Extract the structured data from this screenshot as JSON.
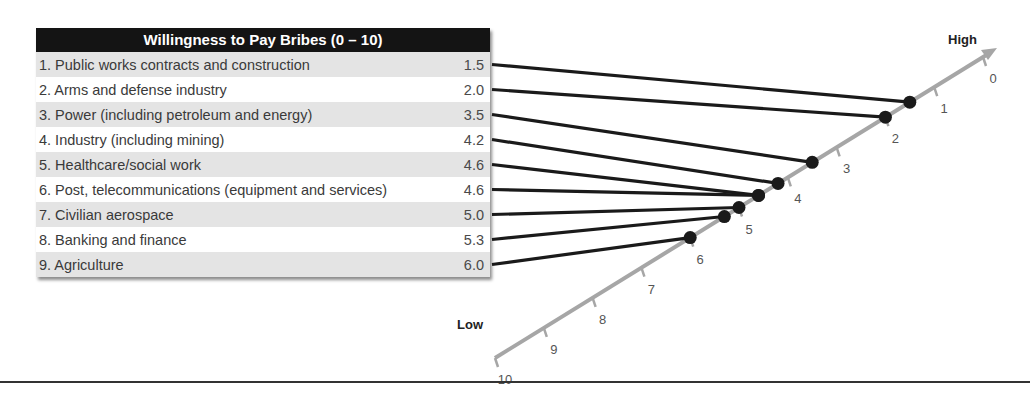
{
  "table": {
    "title": "Willingness to Pay Bribes (0 – 10)",
    "rows": [
      {
        "label": "1. Public works contracts and construction",
        "value": "1.5"
      },
      {
        "label": "2. Arms and defense industry",
        "value": "2.0"
      },
      {
        "label": "3. Power (including petroleum and energy)",
        "value": "3.5"
      },
      {
        "label": "4. Industry (including mining)",
        "value": "4.2"
      },
      {
        "label": "5. Healthcare/social work",
        "value": "4.6"
      },
      {
        "label": "6. Post, telecommunications (equipment and services)",
        "value": "4.6"
      },
      {
        "label": "7. Civilian aerospace",
        "value": "5.0"
      },
      {
        "label": "8. Banking and finance",
        "value": "5.3"
      },
      {
        "label": "9. Agriculture",
        "value": "6.0"
      }
    ]
  },
  "axis": {
    "high_label": "High",
    "low_label": "Low",
    "ticks": [
      "0",
      "1",
      "2",
      "3",
      "4",
      "5",
      "6",
      "7",
      "8",
      "9",
      "10"
    ]
  },
  "colors": {
    "header_bg": "#141414",
    "row_alt": "#e4e4e4",
    "axis": "#a6a6a6",
    "connector": "#1a1a1a"
  },
  "chart_data": {
    "type": "scatter",
    "title": "Willingness to Pay Bribes (0 – 10)",
    "xlabel": "",
    "ylabel": "",
    "axis_range": [
      0,
      10
    ],
    "axis_direction": "diagonal; 0 = High (top-right), 10 = Low (bottom-left)",
    "categories": [
      "Public works contracts and construction",
      "Arms and defense industry",
      "Power (including petroleum and energy)",
      "Industry (including mining)",
      "Healthcare/social work",
      "Post, telecommunications (equipment and services)",
      "Civilian aerospace",
      "Banking and finance",
      "Agriculture"
    ],
    "values": [
      1.5,
      2.0,
      3.5,
      4.2,
      4.6,
      4.6,
      5.0,
      5.3,
      6.0
    ],
    "tick_labels": [
      "0",
      "1",
      "2",
      "3",
      "4",
      "5",
      "6",
      "7",
      "8",
      "9",
      "10"
    ],
    "annotations": [
      "High",
      "Low"
    ],
    "grid": false,
    "legend": null
  }
}
